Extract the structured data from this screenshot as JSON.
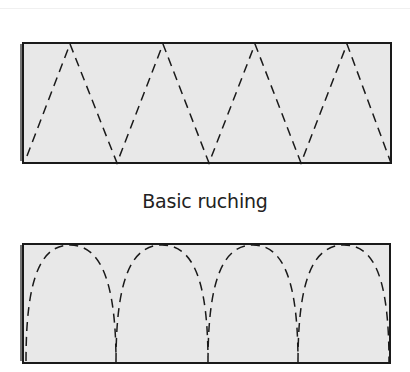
{
  "caption": "Basic ruching",
  "colors": {
    "fabric_fill": "#e8e8e8",
    "outline": "#1a1a1a",
    "stitch_line": "#1a1a1a",
    "background": "#ffffff"
  },
  "panels": [
    {
      "name": "zigzag-panel",
      "stitch_pattern": "zigzag"
    },
    {
      "name": "arch-panel",
      "stitch_pattern": "arches"
    }
  ]
}
